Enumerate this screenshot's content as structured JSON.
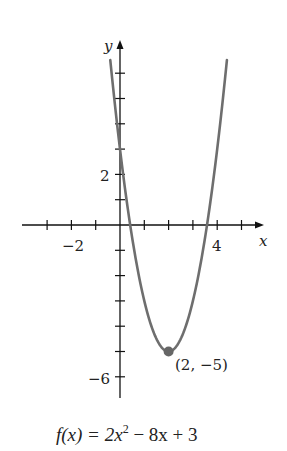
{
  "chart_data": {
    "type": "line",
    "title": "",
    "function": "f(x) = 2x^2 - 8x + 3",
    "caption": {
      "prefix": "f(x) = 2x",
      "exponent": "2",
      "suffix": " − 8x + 3"
    },
    "xlabel": "x",
    "ylabel": "y",
    "xlim": [
      -4,
      5.8
    ],
    "ylim": [
      -7,
      7.3
    ],
    "x_ticks": [
      -3,
      -2,
      -1,
      1,
      2,
      3,
      4,
      5
    ],
    "y_ticks": [
      -6,
      -5,
      -4,
      -3,
      -2,
      -1,
      1,
      2,
      3,
      4,
      5,
      6
    ],
    "x_tick_labels": [
      {
        "value": -2,
        "text": "−2"
      },
      {
        "value": 4,
        "text": "4"
      }
    ],
    "y_tick_labels": [
      {
        "value": 2,
        "text": "2"
      },
      {
        "value": -6,
        "text": "−6"
      }
    ],
    "grid": false,
    "series": [
      {
        "name": "f(x) = 2x^2 - 8x + 3",
        "x": [
          -0.4,
          0,
          0.5,
          1,
          1.5,
          2,
          2.5,
          3,
          3.5,
          4,
          4.4
        ],
        "y": [
          6.52,
          3,
          -0.5,
          -3,
          -4.5,
          -5,
          -4.5,
          -3,
          -0.5,
          3,
          6.52
        ],
        "color": "#6e6e6e"
      }
    ],
    "annotations": [
      {
        "type": "point",
        "x": 2,
        "y": -5,
        "text": "(2, −5)",
        "color": "#666666"
      }
    ]
  },
  "labels": {
    "x_axis": "x",
    "y_axis": "y",
    "tick_neg2": "−2",
    "tick_4": "4",
    "tick_2": "2",
    "tick_neg6": "−6",
    "vertex": "(2, −5)"
  }
}
